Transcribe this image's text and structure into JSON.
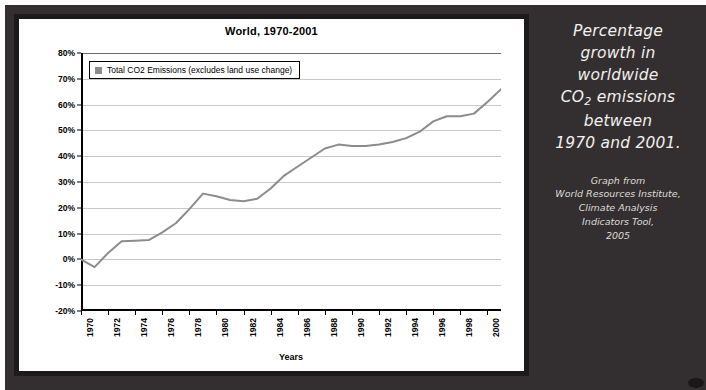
{
  "chart_data": {
    "type": "line",
    "title": "World, 1970-2001",
    "xlabel": "Years",
    "ylabel": "Percentage Growth from 1970",
    "ylim": [
      -20,
      80
    ],
    "ytick_labels": [
      "80%",
      "70%",
      "60%",
      "50%",
      "40%",
      "30%",
      "20%",
      "10%",
      "0%",
      "-10%",
      "-20%"
    ],
    "ytick_values": [
      80,
      70,
      60,
      50,
      40,
      30,
      20,
      10,
      0,
      -10,
      -20
    ],
    "xlim": [
      1970,
      2001
    ],
    "xtick_labels": [
      "1970",
      "1972",
      "1974",
      "1976",
      "1978",
      "1980",
      "1982",
      "1984",
      "1986",
      "1988",
      "1990",
      "1992",
      "1994",
      "1996",
      "1998",
      "2000"
    ],
    "xtick_values": [
      1970,
      1972,
      1974,
      1976,
      1978,
      1980,
      1982,
      1984,
      1986,
      1988,
      1990,
      1992,
      1994,
      1996,
      1998,
      2000
    ],
    "grid": true,
    "legend_position": "top-left",
    "series": [
      {
        "name": "Total CO2 Emissions (excludes land use change)",
        "color": "#8c8c8c",
        "x": [
          1970,
          1971,
          1972,
          1973,
          1974,
          1975,
          1976,
          1977,
          1978,
          1979,
          1980,
          1981,
          1982,
          1983,
          1984,
          1985,
          1986,
          1987,
          1988,
          1989,
          1990,
          1991,
          1992,
          1993,
          1994,
          1995,
          1996,
          1997,
          1998,
          1999,
          2000,
          2001
        ],
        "values": [
          0,
          -3,
          2.5,
          7,
          7.2,
          7.5,
          10.5,
          14,
          19.5,
          25.5,
          24.5,
          23,
          22.5,
          23.5,
          27.5,
          32.5,
          36,
          39.5,
          43,
          44.5,
          44,
          44,
          44.5,
          45.5,
          47,
          49.5,
          53.5,
          55.5,
          55.5,
          56.5,
          61,
          66
        ]
      }
    ]
  },
  "legend": {
    "label": "Total CO2 Emissions (excludes land use change)",
    "swatch_color": "#8c8c8c"
  },
  "caption": {
    "line1": "Percentage",
    "line2": "growth in",
    "line3": "worldwide",
    "line4_pre": "CO",
    "line4_sub": "2",
    "line4_post": " emissions",
    "line5": "between",
    "line6": "1970 and 2001."
  },
  "source": {
    "line1": "Graph from",
    "line2": "World Resources Institute,",
    "line3": "Climate Analysis",
    "line4": "Indicators Tool,",
    "line5": "2005"
  },
  "colors": {
    "background": "#332f30",
    "chart_background": "#ffffff",
    "frame": "#1c1a1b",
    "series": "#8c8c8c",
    "grid": "#c9c9c9",
    "caption_text": "#f2f0ee"
  }
}
